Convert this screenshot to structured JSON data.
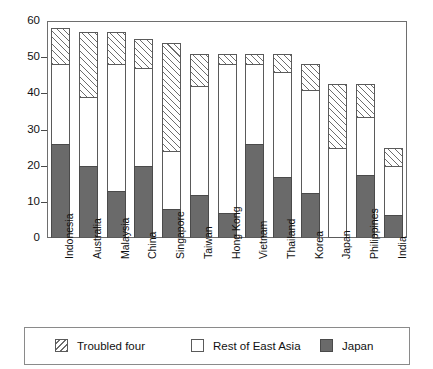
{
  "chart_data": {
    "type": "bar",
    "subtype": "stacked-vertical",
    "title": "",
    "xlabel": "",
    "ylabel": "",
    "ylim": [
      0,
      60
    ],
    "yticks": [
      0,
      10,
      20,
      30,
      40,
      50,
      60
    ],
    "ytick_labels": [
      "0",
      "10",
      "20",
      "30",
      "40",
      "50",
      "60"
    ],
    "grid": false,
    "legend_position": "bottom",
    "categories": [
      "Indonesia",
      "Australia",
      "Malaysia",
      "China",
      "Singapore",
      "Taiwan",
      "Hong Kong",
      "Vietnam",
      "Thailand",
      "Korea",
      "Japan",
      "Philippines",
      "India"
    ],
    "series": [
      {
        "name": "Japan",
        "style": "solid-dark",
        "color": "#6a6a6a",
        "values": [
          26,
          20,
          13,
          20,
          8,
          12,
          7,
          26,
          17,
          12.5,
          0,
          17.5,
          6.5
        ]
      },
      {
        "name": "Rest of East Asia",
        "style": "white",
        "color": "#ffffff",
        "values": [
          22,
          19,
          35,
          27,
          16,
          30,
          41,
          22,
          29,
          28.5,
          25,
          16,
          13.5
        ]
      },
      {
        "name": "Troubled four",
        "style": "hatched",
        "color": "#ffffff",
        "values": [
          10,
          18,
          9,
          8,
          30,
          9,
          3,
          3,
          5,
          7,
          17.5,
          9,
          5
        ]
      }
    ],
    "totals": [
      58,
      57,
      57,
      55,
      54,
      51,
      51,
      51,
      51,
      48,
      42.5,
      42.5,
      25
    ]
  },
  "legend": {
    "items": [
      {
        "label": "Troubled four",
        "swatch": "hatched-swatch"
      },
      {
        "label": "Rest of East Asia",
        "swatch": "white-swatch"
      },
      {
        "label": "Japan",
        "swatch": "dark-swatch"
      }
    ]
  },
  "colors": {
    "japan_fill": "#6a6a6a",
    "rest_fill": "#ffffff",
    "hatch_line": "#6d6d6d",
    "axis": "#6e6e6e",
    "text": "#111111"
  }
}
